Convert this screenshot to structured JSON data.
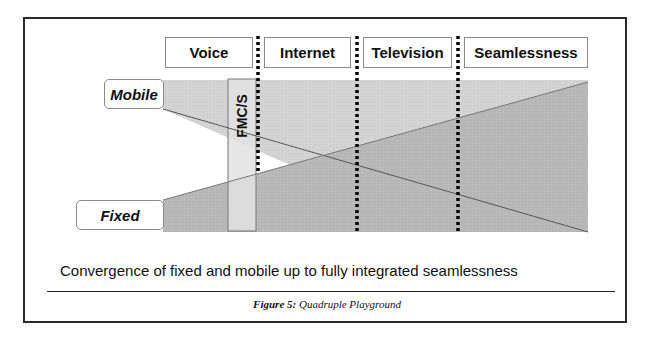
{
  "figure": {
    "columns": [
      {
        "label": "Voice"
      },
      {
        "label": "Internet"
      },
      {
        "label": "Television"
      },
      {
        "label": "Seamlessness"
      }
    ],
    "rows": [
      {
        "label": "Mobile"
      },
      {
        "label": "Fixed"
      }
    ],
    "fmc_label": "FMC/S",
    "caption": "Convergence of fixed and mobile up to fully integrated seamlessness",
    "figure_number": "Figure 5:",
    "figure_title": "Quadruple Playground"
  },
  "colors": {
    "frame": "#2a2a2a",
    "mobile_fill": "#d6d6d6",
    "fixed_fill": "#b8b8b8",
    "fmc_fill": "#e4e4e4",
    "divider": "#000000"
  }
}
